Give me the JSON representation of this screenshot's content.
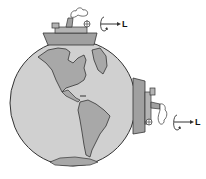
{
  "figure": {
    "labels": {
      "top_ship_L": "L",
      "side_ship_L": "L"
    },
    "colors": {
      "ocean": "#d0d0d0",
      "land": "#a8a8a8",
      "ship_hull": "#a0a0a0",
      "outline": "#333333",
      "background": "#ffffff"
    }
  }
}
